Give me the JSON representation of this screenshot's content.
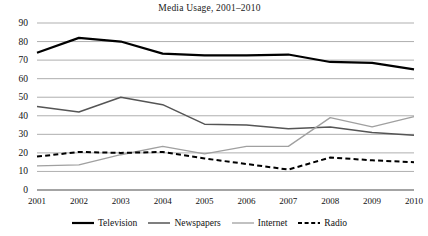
{
  "chart_data": {
    "type": "line",
    "title": "Media Usage, 2001–2010",
    "xlabel": "",
    "ylabel": "",
    "x": [
      "2001",
      "2002",
      "2003",
      "2004",
      "2005",
      "2006",
      "2007",
      "2008",
      "2009",
      "2010"
    ],
    "categories": [
      "2001",
      "2002",
      "2003",
      "2004",
      "2005",
      "2006",
      "2007",
      "2008",
      "2009",
      "2010"
    ],
    "ylim": [
      0,
      90
    ],
    "xlim": [
      "2001",
      "2010"
    ],
    "yticks": [
      0,
      10,
      20,
      30,
      40,
      50,
      60,
      70,
      80,
      90
    ],
    "ytick_labels": [
      "0",
      "10",
      "20",
      "30",
      "40",
      "50",
      "60",
      "70",
      "80",
      "90"
    ],
    "grid": true,
    "grid_axis": "y",
    "legend_position": "bottom",
    "series": [
      {
        "name": "Television",
        "color": "#000000",
        "line_style": "solid",
        "line_width": 2.2,
        "values": [
          74,
          82,
          80,
          73.5,
          72.5,
          72.5,
          73,
          69,
          68.5,
          65
        ]
      },
      {
        "name": "Newspapers",
        "color": "#555555",
        "line_style": "solid",
        "line_width": 1.5,
        "values": [
          45,
          42,
          50,
          46,
          35.5,
          35,
          33,
          34,
          31,
          29.5
        ]
      },
      {
        "name": "Internet",
        "color": "#a0a0a0",
        "line_style": "solid",
        "line_width": 1.3,
        "values": [
          13,
          13.5,
          19,
          23.5,
          19.5,
          23.5,
          23.5,
          39,
          34,
          39.5
        ]
      },
      {
        "name": "Radio",
        "color": "#000000",
        "line_style": "dashed",
        "line_width": 2,
        "values": [
          18,
          20.5,
          20,
          20.5,
          17,
          14,
          11,
          17.5,
          16,
          15
        ]
      }
    ]
  },
  "axes": {
    "ytick_labels": [
      "90",
      "80",
      "70",
      "60",
      "50",
      "40",
      "30",
      "20",
      "10",
      "0"
    ],
    "xtick_labels": [
      "2001",
      "2002",
      "2003",
      "2004",
      "2005",
      "2006",
      "2007",
      "2008",
      "2009",
      "2010"
    ]
  },
  "legend": {
    "items": [
      {
        "label": "Television",
        "swatch": "solid-thick-black-line-icon"
      },
      {
        "label": "Newspapers",
        "swatch": "solid-medium-gray-line-icon"
      },
      {
        "label": "Internet",
        "swatch": "solid-thin-lightgray-line-icon"
      },
      {
        "label": "Radio",
        "swatch": "dashed-black-line-icon"
      }
    ]
  }
}
